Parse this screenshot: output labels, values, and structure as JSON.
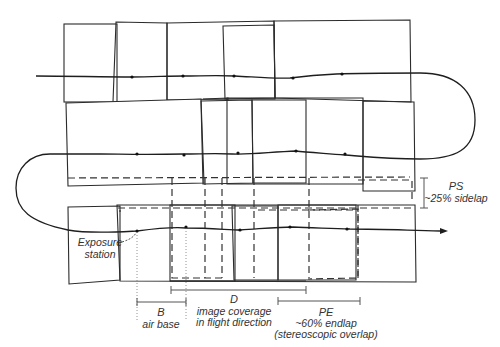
{
  "diagram": {
    "flight_strips": 3,
    "labels": {
      "ps_symbol": "PS",
      "ps_text": "~25% sidelap",
      "exposure_line1": "Exposure",
      "exposure_line2": "station",
      "b_symbol": "B",
      "b_text": "air base",
      "d_symbol": "D",
      "d_text_line1": "image coverage",
      "d_text_line2": "in flight direction",
      "pe_symbol": "PE",
      "pe_text_line1": "~60% endlap",
      "pe_text_line2": "(stereoscopic overlap)"
    },
    "overlap": {
      "sidelap_percent": 25,
      "endlap_percent": 60
    },
    "colors": {
      "line": "#2b2b2b",
      "text": "#333333",
      "background": "#ffffff"
    }
  }
}
